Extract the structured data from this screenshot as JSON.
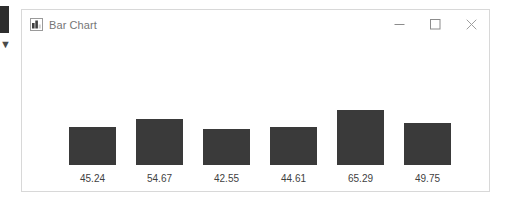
{
  "window": {
    "title": "Bar Chart",
    "icon": "bar-chart-icon",
    "controls": {
      "minimize": "–",
      "maximize": "□",
      "close": "✕"
    },
    "colors": {
      "bar": "#3a3a3a",
      "background": "#ffffff",
      "border": "#d8d8d8",
      "title_text": "#767676",
      "label_text": "#3f3f3f"
    }
  },
  "chart_data": {
    "type": "bar",
    "title": "",
    "xlabel": "",
    "ylabel": "",
    "grid": false,
    "legend": "none",
    "categories": [
      "45.24",
      "54.67",
      "42.55",
      "44.61",
      "65.29",
      "49.75"
    ],
    "values": [
      45.24,
      54.67,
      42.55,
      44.61,
      65.29,
      49.75
    ],
    "labels": [
      "45.24",
      "54.67",
      "42.55",
      "44.61",
      "65.29",
      "49.75"
    ],
    "ylim": [
      0,
      65.29
    ],
    "bar_color": "#3a3a3a"
  }
}
